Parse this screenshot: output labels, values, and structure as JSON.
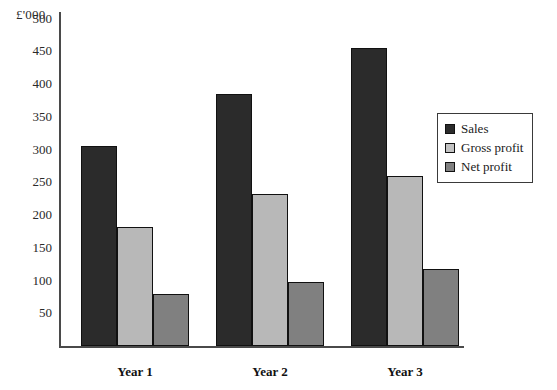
{
  "chart_data": {
    "type": "bar",
    "title": "",
    "subtitle": "",
    "xlabel": "",
    "ylabel": "£'000",
    "axis_unit_label": "£'000",
    "categories": [
      "Year 1",
      "Year 2",
      "Year 3"
    ],
    "series": [
      {
        "name": "Sales",
        "color": "#2b2b2b",
        "values": [
          305,
          385,
          455
        ]
      },
      {
        "name": "Gross profit",
        "color": "#b8b8b8",
        "values": [
          182,
          232,
          260
        ]
      },
      {
        "name": "Net profit",
        "color": "#808080",
        "values": [
          80,
          98,
          117
        ]
      }
    ],
    "ylim": [
      0,
      510
    ],
    "yticks": [
      50,
      100,
      150,
      200,
      250,
      300,
      350,
      400,
      450,
      500
    ],
    "ytick_labels": [
      "50",
      "100",
      "150",
      "200",
      "250",
      "300",
      "350",
      "400",
      "450",
      "500"
    ],
    "grid": false,
    "legend_position": "upper-right-inside",
    "legend_entries": [
      "Sales",
      "Gross profit",
      "Net profit"
    ]
  },
  "colors": {
    "sales": "#2b2b2b",
    "gross_profit": "#b8b8b8",
    "net_profit": "#808080",
    "axis": "#4a4a4a",
    "text": "#1a1a1a",
    "background": "#ffffff"
  }
}
